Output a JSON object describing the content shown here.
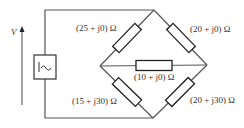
{
  "diagram": {
    "type": "AC bridge circuit",
    "source": {
      "symbol": "ac-source",
      "glyph": "|~"
    },
    "voltage_label": "V",
    "impedances": {
      "top_left": "(25 + j0) Ω",
      "top_right": "(20 + j0) Ω",
      "middle": "(10 + j0) Ω",
      "bottom_left": "(15 + j30) Ω",
      "bottom_right": "(20 + j30) Ω"
    },
    "colors": {
      "wire": "#555555",
      "component": "#222222",
      "text": "#333333",
      "background": "#ffffff"
    }
  }
}
